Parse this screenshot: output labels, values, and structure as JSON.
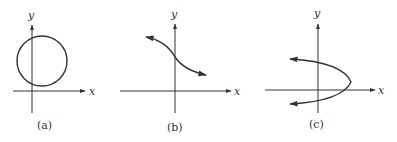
{
  "figure": {
    "panels": [
      {
        "id": "a",
        "caption": "(a)",
        "x_label": "x",
        "y_label": "y",
        "curve": "circle"
      },
      {
        "id": "b",
        "caption": "(b)",
        "x_label": "x",
        "y_label": "y",
        "curve": "decreasing-s-curve-with-arrows"
      },
      {
        "id": "c",
        "caption": "(c)",
        "x_label": "x",
        "y_label": "y",
        "curve": "left-opening-parabola-with-arrows"
      }
    ],
    "colors": {
      "ink": "#333333",
      "background": "#ffffff"
    }
  }
}
